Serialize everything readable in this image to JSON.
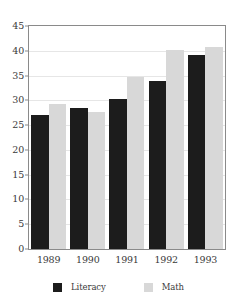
{
  "chart_data": {
    "type": "bar",
    "title": "",
    "xlabel": "",
    "ylabel": "",
    "categories": [
      "1989",
      "1990",
      "1991",
      "1992",
      "1993"
    ],
    "series": [
      {
        "name": "Literacy",
        "color": "#1c1c1c",
        "values": [
          27.0,
          28.5,
          30.3,
          33.9,
          39.1
        ]
      },
      {
        "name": "Math",
        "color": "#d8d8d8",
        "values": [
          29.2,
          27.7,
          34.7,
          40.2,
          40.8
        ]
      }
    ],
    "ylim": [
      0,
      45
    ],
    "ytick_step": 5,
    "yticks": [
      "0",
      "5",
      "10",
      "15",
      "20",
      "25",
      "30",
      "35",
      "40",
      "45"
    ],
    "grid": true,
    "grid_axis": "y",
    "legend_position": "bottom",
    "frame_color": "#8a8a8a",
    "grid_color": "#e6e6e6",
    "background": "#ffffff"
  },
  "legend": {
    "entries": [
      {
        "label": "Literacy"
      },
      {
        "label": "Math"
      }
    ]
  }
}
